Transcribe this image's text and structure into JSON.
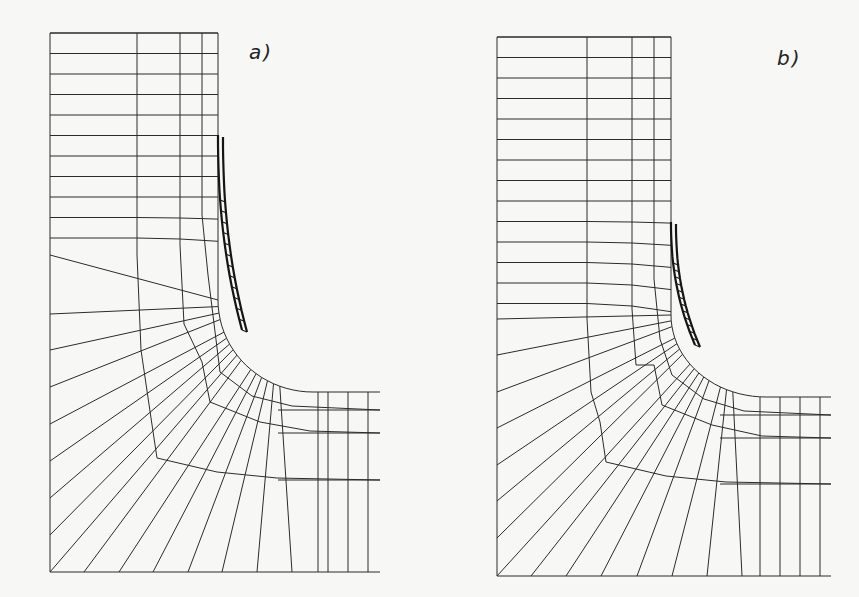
{
  "figure": {
    "line_color": "#2b2b2b",
    "background": "#f7f7f5"
  },
  "panels": [
    {
      "id": "a",
      "label": "a)",
      "description": "Mesh with crack/notch refinement band (longer refined zone)"
    },
    {
      "id": "b",
      "label": "b)",
      "description": "Mesh with crack/notch refinement band (shorter refined zone)"
    }
  ]
}
